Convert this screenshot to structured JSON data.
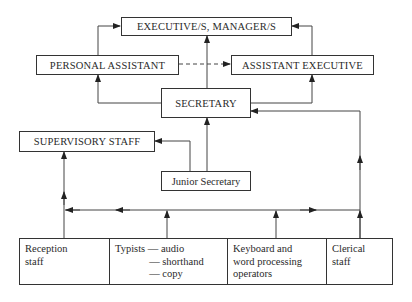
{
  "diagram": {
    "nodes": {
      "executive": "EXECUTIVE/S, MANAGER/S",
      "personal_assistant": "PERSONAL ASSISTANT",
      "assistant_executive": "ASSISTANT EXECUTIVE",
      "secretary": "SECRETARY",
      "supervisory_staff": "SUPERVISORY STAFF",
      "junior_secretary": "Junior Secretary"
    },
    "bottom_row": [
      {
        "id": "reception",
        "text": "Reception\nstaff"
      },
      {
        "id": "typists",
        "text": "Typists — audio\n             — shorthand\n             — copy"
      },
      {
        "id": "keyboard",
        "text": "Keyboard and\nword processing\noperators"
      },
      {
        "id": "clerical",
        "text": "Clerical\nstaff"
      }
    ],
    "edges": [
      {
        "from": "personal_assistant",
        "to": "executive",
        "style": "solid"
      },
      {
        "from": "assistant_executive",
        "to": "executive",
        "style": "solid"
      },
      {
        "from": "secretary",
        "to": "executive",
        "style": "solid"
      },
      {
        "from": "personal_assistant",
        "to": "assistant_executive",
        "style": "dashed"
      },
      {
        "from": "secretary",
        "to": "personal_assistant",
        "style": "solid"
      },
      {
        "from": "secretary",
        "to": "assistant_executive",
        "style": "solid"
      },
      {
        "from": "junior_secretary",
        "to": "secretary",
        "style": "solid"
      },
      {
        "from": "junior_secretary",
        "to": "supervisory_staff",
        "style": "solid"
      },
      {
        "from": "reception",
        "to": "supervisory_staff",
        "style": "solid"
      },
      {
        "from": "clerical",
        "to": "secretary",
        "style": "solid"
      },
      {
        "from": "typists",
        "to": "distribution_line",
        "style": "solid"
      },
      {
        "from": "keyboard",
        "to": "distribution_line",
        "style": "solid"
      }
    ],
    "colors": {
      "line": "#333333",
      "text": "#2a2a2a",
      "background": "#ffffff"
    }
  }
}
